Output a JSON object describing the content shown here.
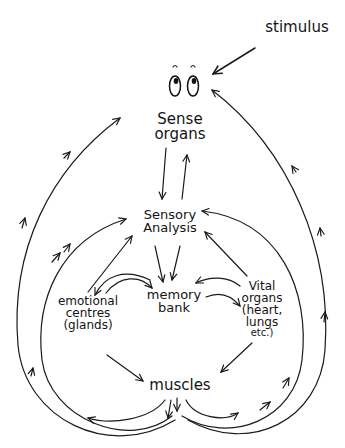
{
  "diagram": {
    "title": "",
    "type": "flow-cycle",
    "nodes": [
      {
        "id": "stimulus",
        "lines": [
          "stimulus"
        ]
      },
      {
        "id": "sense_organs",
        "lines": [
          "Sense",
          "organs"
        ],
        "icon": "eyes-icon"
      },
      {
        "id": "sensory_analysis",
        "lines": [
          "Sensory",
          "Analysis"
        ]
      },
      {
        "id": "memory_bank",
        "lines": [
          "memory",
          "bank"
        ]
      },
      {
        "id": "emotional_centres",
        "lines": [
          "emotional",
          "centres",
          "(glands)"
        ]
      },
      {
        "id": "vital_organs",
        "lines": [
          "Vital",
          "organs",
          "(heart,",
          "lungs",
          "etc.)"
        ]
      },
      {
        "id": "muscles",
        "lines": [
          "muscles"
        ]
      }
    ],
    "edges": [
      {
        "from": "stimulus",
        "to": "sense_organs"
      },
      {
        "from": "sense_organs",
        "to": "sensory_analysis"
      },
      {
        "from": "sensory_analysis",
        "to": "sense_organs"
      },
      {
        "from": "sensory_analysis",
        "to": "memory_bank"
      },
      {
        "from": "emotional_centres",
        "to": "sensory_analysis"
      },
      {
        "from": "emotional_centres",
        "to": "memory_bank"
      },
      {
        "from": "memory_bank",
        "to": "emotional_centres"
      },
      {
        "from": "vital_organs",
        "to": "sensory_analysis"
      },
      {
        "from": "vital_organs",
        "to": "memory_bank"
      },
      {
        "from": "memory_bank",
        "to": "vital_organs"
      },
      {
        "from": "emotional_centres",
        "to": "muscles"
      },
      {
        "from": "vital_organs",
        "to": "muscles"
      },
      {
        "from": "muscles",
        "to": "emotional_centres"
      },
      {
        "from": "muscles",
        "to": "vital_organs"
      },
      {
        "from": "muscles",
        "to": "sensory_analysis",
        "via": "left-inner-loop"
      },
      {
        "from": "muscles",
        "to": "sense_organs",
        "via": "left-outer-loop"
      },
      {
        "from": "muscles",
        "to": "sensory_analysis",
        "via": "right-inner-loop"
      },
      {
        "from": "muscles",
        "to": "sense_organs",
        "via": "right-outer-loop"
      }
    ]
  },
  "colors": {
    "ink": "#1a1a1a",
    "background": "#ffffff"
  }
}
